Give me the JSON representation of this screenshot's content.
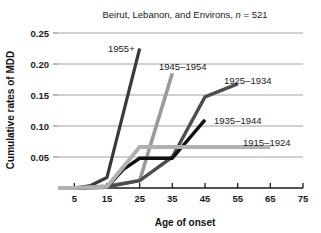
{
  "chart_data": {
    "type": "line",
    "title": "Beirut, Lebanon, and Environs, n = 521",
    "title_main": "Beirut, Lebanon, and Environs, ",
    "title_italic": "n",
    "title_tail": " = 521",
    "xlabel": "Age of onset",
    "ylabel": "Cumulative rates of MDD",
    "xlim": [
      0,
      75
    ],
    "ylim": [
      0,
      0.25
    ],
    "xticks": [
      5,
      15,
      25,
      35,
      45,
      55,
      65,
      75
    ],
    "xtick_labels": [
      "5",
      "15",
      "25",
      "35",
      "45",
      "55",
      "65",
      "75"
    ],
    "yticks": [
      0.05,
      0.1,
      0.15,
      0.2,
      0.25
    ],
    "ytick_labels": [
      "0.05",
      "0.10",
      "0.15",
      "0.20",
      "0.25"
    ],
    "grid": true,
    "legend": "inline-labels",
    "series": [
      {
        "name": "1955+",
        "label": "1955+",
        "color": "#3a3a3a",
        "width": 3.2,
        "x": [
          0,
          5,
          10,
          15,
          25
        ],
        "values": [
          0.0,
          0.0,
          0.004,
          0.017,
          0.225
        ]
      },
      {
        "name": "1945-1954",
        "label": "1945–1954",
        "color": "#9a9a9a",
        "width": 3.6,
        "x": [
          0,
          5,
          15,
          25,
          35
        ],
        "values": [
          0.0,
          0.0,
          0.003,
          0.012,
          0.185
        ]
      },
      {
        "name": "1925-1934",
        "label": "1925–1934",
        "color": "#4d4d4d",
        "width": 3.4,
        "x": [
          0,
          5,
          15,
          25,
          35,
          45,
          55
        ],
        "values": [
          0.0,
          0.0,
          0.002,
          0.012,
          0.05,
          0.147,
          0.168
        ]
      },
      {
        "name": "1935-1944",
        "label": "1935–1944",
        "color": "#111111",
        "width": 3.4,
        "x": [
          0,
          5,
          15,
          20,
          25,
          35,
          45
        ],
        "values": [
          0.0,
          0.0,
          0.001,
          0.03,
          0.048,
          0.048,
          0.11
        ]
      },
      {
        "name": "1915-1924",
        "label": "1915–1924",
        "color": "#b0b0b0",
        "width": 4.0,
        "x": [
          0,
          5,
          15,
          25,
          65
        ],
        "values": [
          0.0,
          0.0,
          0.002,
          0.066,
          0.066
        ]
      }
    ],
    "annotations": [
      {
        "name": "label-1955",
        "text": "1955+",
        "x": 108,
        "y": 52,
        "anchor": "start"
      },
      {
        "name": "label-1945-1954",
        "text": "1945–1954",
        "x": 159,
        "y": 70,
        "anchor": "start"
      },
      {
        "name": "label-1925-1934",
        "text": "1925–1934",
        "x": 224,
        "y": 84,
        "anchor": "start"
      },
      {
        "name": "label-1935-1944",
        "text": "1935–1944",
        "x": 214,
        "y": 124,
        "anchor": "start"
      },
      {
        "name": "label-1915-1924",
        "text": "1915–1924",
        "x": 243,
        "y": 146,
        "anchor": "start"
      }
    ]
  }
}
